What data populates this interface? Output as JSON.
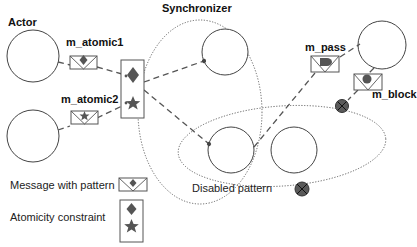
{
  "labels": {
    "actor": "Actor",
    "synchronizer": "Synchronizer",
    "m_atomic1": "m_atomic1",
    "m_atomic2": "m_atomic2",
    "m_pass": "m_pass",
    "m_block": "m_block"
  },
  "legend": {
    "message_with_pattern": "Message with pattern",
    "atomicity_constraint": "Atomicity constraint",
    "disabled_pattern": "Disabled pattern"
  },
  "colors": {
    "stroke": "#444444",
    "fill_dark": "#555555",
    "disabled_fill": "#5a5a5a",
    "background": "#ffffff"
  },
  "nodes": [
    {
      "id": "actor-top-left",
      "shape": "circle"
    },
    {
      "id": "actor-bottom-left",
      "shape": "circle"
    },
    {
      "id": "sync-top-circle",
      "shape": "circle"
    },
    {
      "id": "sync-lower-circle",
      "shape": "circle"
    },
    {
      "id": "right-middle-circle",
      "shape": "circle"
    },
    {
      "id": "top-right-circle",
      "shape": "circle"
    }
  ],
  "messages": [
    {
      "name": "m_atomic1",
      "pattern": "diamond"
    },
    {
      "name": "m_atomic2",
      "pattern": "star"
    },
    {
      "name": "m_pass",
      "pattern": "half-disc"
    },
    {
      "name": "m_block",
      "pattern": "circle",
      "disabled": true
    }
  ],
  "regions": [
    {
      "name": "Synchronizer",
      "style": "dotted-ellipse"
    },
    {
      "name": "constraint-scope",
      "style": "dotted-ellipse"
    }
  ]
}
